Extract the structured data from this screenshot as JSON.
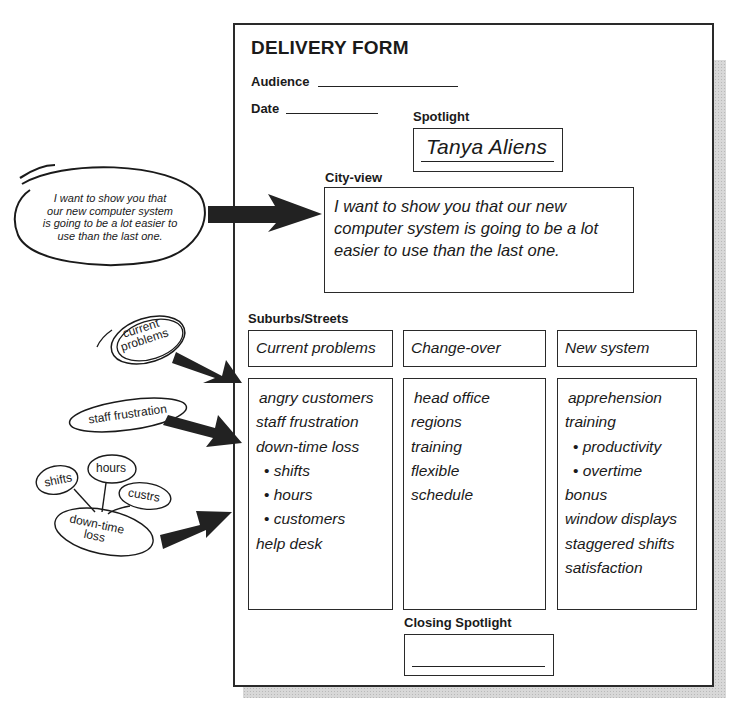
{
  "form": {
    "title": "DELIVERY FORM",
    "audience_label": "Audience",
    "date_label": "Date",
    "spotlight_label": "Spotlight",
    "spotlight_value": "Tanya Aliens",
    "cityview_label": "City-view",
    "cityview_text": "I want to show you that our new computer system is going to be a lot easier to use than the last one.",
    "suburbs_label": "Suburbs/Streets",
    "columns": [
      {
        "heading": "Current problems",
        "items": [
          {
            "text": "angry customers",
            "sub": false
          },
          {
            "text": "staff frustration",
            "sub": false
          },
          {
            "text": "down-time loss",
            "sub": false
          },
          {
            "text": "shifts",
            "sub": true
          },
          {
            "text": "hours",
            "sub": true
          },
          {
            "text": "customers",
            "sub": true
          },
          {
            "text": "help desk",
            "sub": false
          }
        ]
      },
      {
        "heading": "Change-over",
        "items": [
          {
            "text": "head office",
            "sub": false
          },
          {
            "text": "regions",
            "sub": false
          },
          {
            "text": "training",
            "sub": false
          },
          {
            "text": "flexible",
            "sub": false
          },
          {
            "text": "schedule",
            "sub": false
          }
        ]
      },
      {
        "heading": "New system",
        "items": [
          {
            "text": "apprehension",
            "sub": false
          },
          {
            "text": "training",
            "sub": false
          },
          {
            "text": "productivity",
            "sub": true
          },
          {
            "text": "overtime",
            "sub": true
          },
          {
            "text": "bonus",
            "sub": false
          },
          {
            "text": "window displays",
            "sub": false
          },
          {
            "text": "staggered shifts",
            "sub": false
          },
          {
            "text": "satisfaction",
            "sub": false
          }
        ]
      }
    ],
    "closing_label": "Closing Spotlight"
  },
  "notes": {
    "speech_bubble": [
      "I want to show you that",
      "our new computer system",
      "is going to be a lot easier to",
      "use than the last one."
    ],
    "current_problems": [
      "current",
      "problems"
    ],
    "staff_frustration": "staff frustration",
    "mindmap": {
      "center": [
        "down-time",
        "loss"
      ],
      "branches": [
        "shifts",
        "hours",
        "custrs"
      ]
    }
  },
  "colors": {
    "ink": "#1a1a1a",
    "shadow": "#d8d8d8",
    "arrow": "#222222"
  }
}
